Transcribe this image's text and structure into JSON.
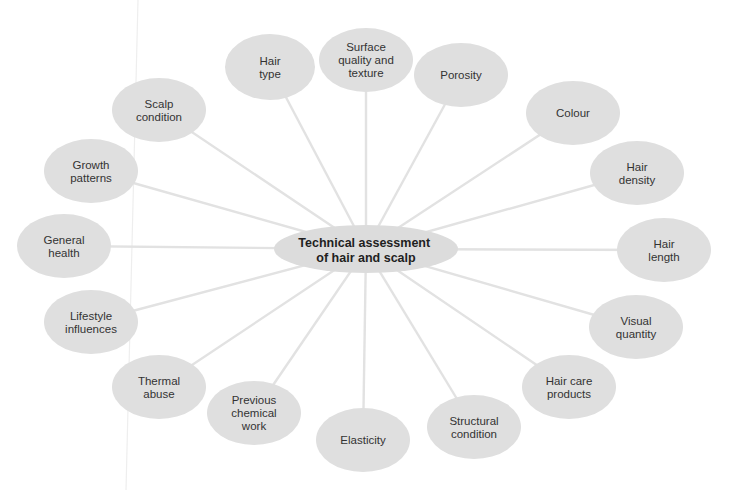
{
  "diagram": {
    "type": "spider-diagram",
    "colors": {
      "node_fill": "#dfdfdf",
      "spoke": "#e2e2e2",
      "text": "#333333"
    },
    "center": {
      "label_lines": [
        "Technical assessment",
        "of hair and scalp"
      ]
    },
    "nodes": [
      {
        "id": "hair-type",
        "label_lines": [
          "Hair",
          "type"
        ]
      },
      {
        "id": "surface-quality-and-texture",
        "label_lines": [
          "Surface",
          "quality and",
          "texture"
        ]
      },
      {
        "id": "porosity",
        "label_lines": [
          "Porosity"
        ]
      },
      {
        "id": "colour",
        "label_lines": [
          "Colour"
        ]
      },
      {
        "id": "hair-density",
        "label_lines": [
          "Hair",
          "density"
        ]
      },
      {
        "id": "hair-length",
        "label_lines": [
          "Hair",
          "length"
        ]
      },
      {
        "id": "visual-quantity",
        "label_lines": [
          "Visual",
          "quantity"
        ]
      },
      {
        "id": "hair-care-products",
        "label_lines": [
          "Hair care",
          "products"
        ]
      },
      {
        "id": "structural-condition",
        "label_lines": [
          "Structural",
          "condition"
        ]
      },
      {
        "id": "elasticity",
        "label_lines": [
          "Elasticity"
        ]
      },
      {
        "id": "previous-chemical-work",
        "label_lines": [
          "Previous",
          "chemical",
          "work"
        ]
      },
      {
        "id": "thermal-abuse",
        "label_lines": [
          "Thermal",
          "abuse"
        ]
      },
      {
        "id": "lifestyle-influences",
        "label_lines": [
          "Lifestyle",
          "influences"
        ]
      },
      {
        "id": "general-health",
        "label_lines": [
          "General",
          "health"
        ]
      },
      {
        "id": "growth-patterns",
        "label_lines": [
          "Growth",
          "patterns"
        ]
      },
      {
        "id": "scalp-condition",
        "label_lines": [
          "Scalp",
          "condition"
        ]
      }
    ]
  }
}
